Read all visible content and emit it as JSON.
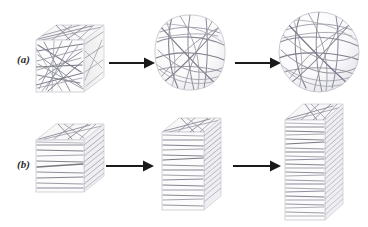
{
  "figure": {
    "background": "#ffffff",
    "width": 368,
    "height": 227,
    "fiber_color": "#8a8a96",
    "fiber_color_dark": "#6e6e7c",
    "outline_color": "#c9c9d0",
    "face_fill": "#fbfbfc",
    "face_fill_side": "#f0f0f3",
    "face_fill_top": "#f6f6f8",
    "arrow_color": "#1a1a1a",
    "label_color": "#2b2b2b"
  },
  "rows": [
    {
      "id": "a",
      "label": "(a)",
      "description": "Random fiber network compressed from cube to rounded cube to sphere",
      "stages": [
        {
          "name": "cube-random-fibers",
          "shape": "cube",
          "fiber_arrangement": "random-isotropic"
        },
        {
          "name": "rounded-cube-random-fibers",
          "shape": "rounded-cube",
          "fiber_arrangement": "random-curved"
        },
        {
          "name": "sphere-random-fibers",
          "shape": "sphere",
          "fiber_arrangement": "random-curved-great-circles"
        }
      ]
    },
    {
      "id": "b",
      "label": "(b)",
      "description": "Layered fiber network stretched from cube to tall slab to tall column",
      "stages": [
        {
          "name": "cube-layered-fibers",
          "shape": "cube",
          "fiber_arrangement": "horizontal-layers"
        },
        {
          "name": "tall-slab-layered-fibers",
          "shape": "tall-box",
          "fiber_arrangement": "horizontal-layers-dense"
        },
        {
          "name": "tall-column-layered-fibers",
          "shape": "tall-column",
          "fiber_arrangement": "horizontal-layers-densest"
        }
      ]
    }
  ],
  "arrows": [
    {
      "name": "arrow-a-1",
      "row": "a",
      "from": "cube-random-fibers",
      "to": "rounded-cube-random-fibers"
    },
    {
      "name": "arrow-a-2",
      "row": "a",
      "from": "rounded-cube-random-fibers",
      "to": "sphere-random-fibers"
    },
    {
      "name": "arrow-b-1",
      "row": "b",
      "from": "cube-layered-fibers",
      "to": "tall-slab-layered-fibers"
    },
    {
      "name": "arrow-b-2",
      "row": "b",
      "from": "tall-slab-layered-fibers",
      "to": "tall-column-layered-fibers"
    }
  ]
}
